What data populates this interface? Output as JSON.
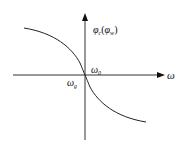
{
  "diagram": {
    "y_axis_label": {
      "main": "φ",
      "main_sub": "c",
      "paren_open": "(",
      "paren_main": "φ",
      "paren_sub": "w",
      "paren_close": ")"
    },
    "x_axis_label": "ω",
    "origin_label_upper": {
      "main": "ω",
      "sub": "0"
    },
    "origin_label_lower": {
      "main": "ω",
      "sub": "g"
    },
    "colors": {
      "line": "#222222",
      "background": "#ffffff"
    }
  }
}
